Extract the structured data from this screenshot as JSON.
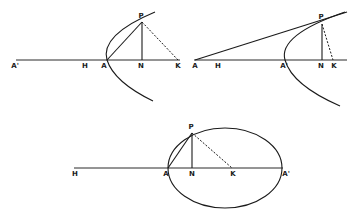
{
  "figures": {
    "parabola_left": {
      "labels": {
        "a_prime": "A'",
        "h": "H",
        "a": "A",
        "n": "N",
        "k": "K",
        "p": "P"
      }
    },
    "parabola_right": {
      "labels": {
        "a": "A",
        "h": "H",
        "a_prime": "A'",
        "n": "N",
        "k": "K",
        "p": "P"
      }
    },
    "ellipse": {
      "labels": {
        "h": "H",
        "a": "A",
        "n": "N",
        "k": "K",
        "a_prime": "A'",
        "p": "P"
      }
    }
  }
}
